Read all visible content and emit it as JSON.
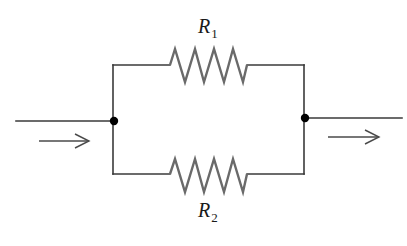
{
  "diagram": {
    "type": "parallel resistor circuit",
    "resistors": [
      {
        "id": "R1",
        "symbol": "R",
        "subscript": "1",
        "branch": "top"
      },
      {
        "id": "R2",
        "symbol": "R",
        "subscript": "2",
        "branch": "bottom"
      }
    ],
    "current_direction": "left-to-right",
    "colors": {
      "wire": "#3a3a3a",
      "resistor": "#6a6a6a",
      "node": "#000000",
      "background": "#ffffff"
    }
  }
}
